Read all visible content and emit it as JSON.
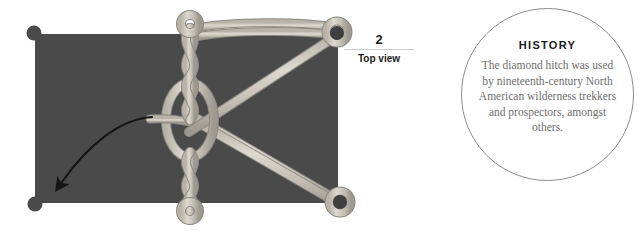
{
  "diagram": {
    "name": "diamond-hitch-knot-step-2",
    "tarp_color": "#4a4a4a",
    "rope_color": "#cfcbc2",
    "rope_shade_color": "#a7a29a",
    "corner_dot_color": "#4a4a4a",
    "arrow_color": "#141414",
    "corner_dots": [
      {
        "name": "top-left",
        "x": 34,
        "y": 33
      },
      {
        "name": "top-right",
        "x": 337,
        "y": 33
      },
      {
        "name": "bottom-right",
        "x": 340,
        "y": 202
      },
      {
        "name": "bottom-left",
        "x": 35,
        "y": 204
      }
    ]
  },
  "step": {
    "number": "2",
    "caption": "Top view"
  },
  "history": {
    "title": "HISTORY",
    "body": "The diamond hitch was used by nineteenth-century North American wilderness trekkers and prospectors, amongst others."
  }
}
